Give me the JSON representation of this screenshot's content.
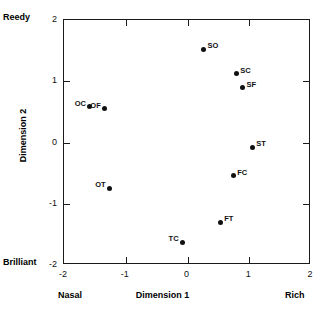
{
  "chart_data": {
    "type": "scatter",
    "title": "",
    "xlabel": "Dimension 1",
    "ylabel": "Dimension 2",
    "xlim": [
      -2,
      2
    ],
    "ylim": [
      -2,
      2
    ],
    "xticks": [
      -2,
      -1,
      0,
      1,
      2
    ],
    "yticks": [
      -2,
      -1,
      0,
      1,
      2
    ],
    "xtick_labels": [
      "-2",
      "-1",
      "0",
      "1",
      "2"
    ],
    "ytick_labels": [
      "-2",
      "-1",
      "0",
      "1",
      "2"
    ],
    "grid": false,
    "legend": "none",
    "axis_poles": {
      "y_high": "Reedy",
      "y_low": "Brilliant",
      "x_low": "Nasal",
      "x_high": "Rich"
    },
    "points": [
      {
        "label": "SO",
        "x": 0.26,
        "y": 1.52,
        "label_side": "right"
      },
      {
        "label": "SC",
        "x": 0.79,
        "y": 1.12,
        "label_side": "right"
      },
      {
        "label": "SF",
        "x": 0.89,
        "y": 0.89,
        "label_side": "right"
      },
      {
        "label": "OC",
        "x": -1.58,
        "y": 0.58,
        "label_side": "left"
      },
      {
        "label": "OF",
        "x": -1.34,
        "y": 0.55,
        "label_side": "left"
      },
      {
        "label": "ST",
        "x": 1.05,
        "y": -0.08,
        "label_side": "right"
      },
      {
        "label": "FC",
        "x": 0.74,
        "y": -0.54,
        "label_side": "right"
      },
      {
        "label": "OT",
        "x": -1.26,
        "y": -0.75,
        "label_side": "left"
      },
      {
        "label": "FT",
        "x": 0.53,
        "y": -1.3,
        "label_side": "right"
      },
      {
        "label": "TC",
        "x": -0.08,
        "y": -1.63,
        "label_side": "left"
      }
    ]
  }
}
